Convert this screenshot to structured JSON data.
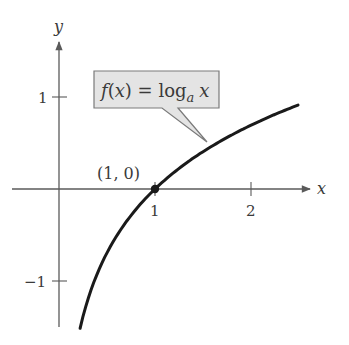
{
  "chart_data": {
    "type": "line",
    "title": "",
    "xlabel": "x",
    "ylabel": "y",
    "function_label": {
      "prefix": "f(x) = log",
      "subscript": "a",
      "suffix": "x"
    },
    "point_label": "(1, 0)",
    "x_ticks": [
      {
        "value": 1,
        "label": "1"
      },
      {
        "value": 2,
        "label": "2"
      }
    ],
    "y_ticks": [
      {
        "value": 1,
        "label": "1"
      },
      {
        "value": -1,
        "label": "−1"
      }
    ],
    "xlim": [
      -0.5,
      2.8
    ],
    "ylim": [
      -1.5,
      1.55
    ],
    "grid": false,
    "series": [
      {
        "name": "f(x) = log_a x",
        "x": [
          0.22,
          0.3,
          0.4,
          0.5,
          0.6,
          0.7,
          0.8,
          0.9,
          1.0,
          1.2,
          1.4,
          1.6,
          1.8,
          2.0,
          2.2,
          2.49
        ],
        "y": [
          -1.51,
          -1.2,
          -0.92,
          -0.69,
          -0.51,
          -0.36,
          -0.22,
          -0.11,
          0.0,
          0.18,
          0.34,
          0.47,
          0.59,
          0.69,
          0.79,
          0.91
        ]
      }
    ],
    "highlighted_points": [
      {
        "x": 1,
        "y": 0
      }
    ],
    "colors": {
      "axis": "#5a5a5a",
      "curve": "#1a1a1a",
      "callout_fill": "#e4e4e4",
      "callout_border": "#7a7a7a",
      "text": "#3a3a3a"
    }
  }
}
